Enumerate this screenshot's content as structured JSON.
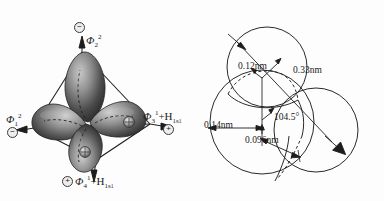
{
  "figure": {
    "background_color": "#fdfdfd",
    "stroke_color": "#1a1a1a",
    "panels": [
      "sp3-hybrid-orbital-tetrahedron",
      "water-molecule-space-filling-model"
    ]
  },
  "left_panel": {
    "title_semantic": "sp3 hybrid orbitals of water in tetrahedral frame",
    "orbital_count": 4,
    "labels": {
      "top": {
        "charge": "⊖",
        "phi": "Φ",
        "superscript": "2",
        "subscript": "2",
        "full": "Φ₂²"
      },
      "left": {
        "charge": "⊖",
        "phi": "Φ",
        "superscript": "2",
        "subscript": "1",
        "full": "Φ₁²"
      },
      "right": {
        "charge": "⊕",
        "phi": "Φ",
        "superscript": "1",
        "subscript": "3",
        "plus": "+",
        "atom": "H",
        "atom_subscript": "1s",
        "atom_subsubscript": "1",
        "full": "Φ₃¹+H₁ₛ₁"
      },
      "bottom": {
        "charge": "⊕",
        "phi": "Φ",
        "superscript": "1",
        "subscript": "4",
        "plus": "+",
        "atom": "H",
        "atom_subscript": "1s",
        "atom_subsubscript": "1",
        "full": "Φ₄¹+H₁ₛ₁"
      }
    },
    "nuclei": {
      "right_lobe_marker": "⊕",
      "bottom_lobe_marker": "⊕"
    }
  },
  "right_panel": {
    "title_semantic": "water molecule dimensions",
    "dimensions": [
      {
        "name": "hydrogen-radius",
        "value": "0.12nm"
      },
      {
        "name": "overall-span",
        "value": "0.33nm"
      },
      {
        "name": "oxygen-radius",
        "value": "0.14nm"
      },
      {
        "name": "oh-bond-length",
        "value": "0.096nm"
      },
      {
        "name": "hoh-bond-angle",
        "value": "104.5°"
      }
    ],
    "labels": {
      "h_radius": "0.12nm",
      "span": "0.33nm",
      "o_radius": "0.14nm",
      "bond_length": "0.096nm",
      "bond_angle": "104.5°"
    }
  }
}
